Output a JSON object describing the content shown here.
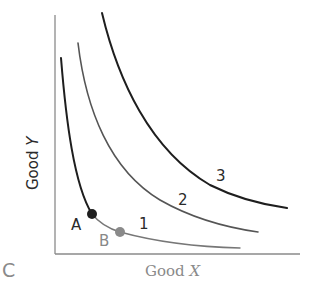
{
  "panel_label": "C",
  "axes": {
    "x_label_prefix": "Good ",
    "x_label_var": "X",
    "y_label_prefix": "Good ",
    "y_label_var": "Y"
  },
  "curves": [
    {
      "label": "1",
      "name": "indifference-curve-1"
    },
    {
      "label": "2",
      "name": "indifference-curve-2"
    },
    {
      "label": "3",
      "name": "indifference-curve-3"
    }
  ],
  "points": [
    {
      "label": "A",
      "color": "#1e1e1e"
    },
    {
      "label": "B",
      "color": "#8a8a8a"
    }
  ],
  "colors": {
    "axis": "#8a8a8a",
    "curve": "#1e1e1e",
    "point_a": "#1e1e1e",
    "point_b": "#8a8a8a"
  }
}
